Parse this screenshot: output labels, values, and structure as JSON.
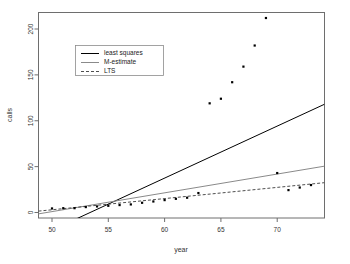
{
  "chart_data": {
    "type": "scatter",
    "title": "",
    "xlabel": "year",
    "ylabel": "calls",
    "xlim": [
      48.8,
      74.2
    ],
    "ylim": [
      -6,
      218
    ],
    "xticks": [
      50,
      55,
      60,
      65,
      70
    ],
    "yticks": [
      0,
      50,
      100,
      150,
      200
    ],
    "grid": false,
    "legend_position": "top-left",
    "point_marker": "filled-square",
    "point_color": "#000000",
    "x": [
      50,
      51,
      52,
      53,
      54,
      55,
      56,
      57,
      58,
      59,
      60,
      61,
      62,
      63,
      64,
      65,
      66,
      67,
      68,
      69,
      70,
      71,
      72,
      73
    ],
    "y": [
      4.4,
      4.7,
      4.7,
      5.9,
      6.6,
      7.3,
      8.1,
      8.8,
      10.6,
      12.0,
      13.5,
      14.9,
      16.1,
      21.2,
      119.0,
      124.0,
      142.0,
      159.0,
      182.0,
      212.0,
      43.0,
      24.4,
      27.2,
      29.9
    ],
    "series": [
      {
        "name": "least squares",
        "type": "line",
        "style": "solid",
        "color": "#000000",
        "endpoints": [
          [
            48.8,
            -26.0
          ],
          [
            74.2,
            118.0
          ]
        ]
      },
      {
        "name": "M-estimate",
        "type": "line",
        "style": "solid",
        "color": "#8a8a8a",
        "endpoints": [
          [
            48.8,
            -1.5
          ],
          [
            74.2,
            50.5
          ]
        ]
      },
      {
        "name": "LTS",
        "type": "line",
        "style": "dashed",
        "color": "#3a3a3a",
        "endpoints": [
          [
            48.8,
            1.5
          ],
          [
            74.2,
            32.5
          ]
        ]
      }
    ],
    "legend": [
      {
        "label": "least squares",
        "style": "solid",
        "color": "#000000"
      },
      {
        "label": "M-estimate",
        "style": "solid",
        "color": "#8a8a8a"
      },
      {
        "label": "LTS",
        "style": "dashed",
        "color": "#3a3a3a"
      }
    ],
    "xtick_labels": [
      "50",
      "55",
      "60",
      "65",
      "70"
    ],
    "ytick_labels": [
      "0",
      "50",
      "100",
      "150",
      "200"
    ]
  }
}
